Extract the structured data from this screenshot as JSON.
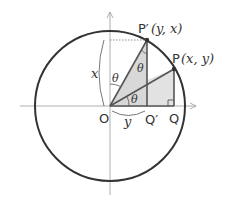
{
  "diagram": {
    "type": "unit-circle-symmetry",
    "points": {
      "O": {
        "label": "O"
      },
      "P": {
        "label": "P",
        "coords": "(x,  y)"
      },
      "P_prime": {
        "label": "P′",
        "coords": "(y,  x)"
      },
      "Q": {
        "label": "Q"
      },
      "Q_prime": {
        "label": "Q′"
      }
    },
    "segment_labels": {
      "vertical": "x",
      "horizontal": "y"
    },
    "angle_label": "θ",
    "colors": {
      "stroke": "#333333",
      "axis": "#999999",
      "fill": "#d9d9d9"
    }
  }
}
